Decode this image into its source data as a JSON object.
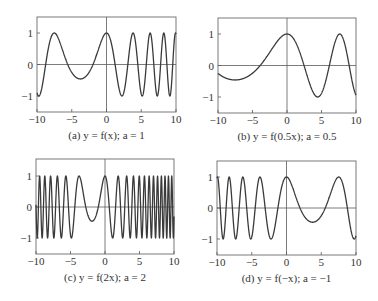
{
  "chart_data": [
    {
      "type": "line",
      "panel": "a",
      "caption": "(a) y = f(x); a = 1",
      "a": 1,
      "xlim": [
        -10,
        10
      ],
      "ylim": [
        -1.5,
        1.5
      ],
      "xticks": [
        -10,
        -5,
        0,
        5,
        10
      ],
      "yticks": [
        -1,
        0,
        1
      ],
      "xtick_labels": [
        "−10",
        "−5",
        "0",
        "5",
        "10"
      ],
      "ytick_labels": [
        "−1",
        "0",
        "1"
      ],
      "description": "Chirp-like curve: peak ~1 at x≈-7.5, min ≈-0.45 at x≈-4, peak 1 at x=0, then faster oscillation between -1 and 1 (peaks at ≈4, 6.7, 8.7)",
      "x": [
        -10,
        -7.5,
        -4,
        0,
        2.1,
        4,
        5.4,
        6.7,
        8,
        8.7,
        10
      ],
      "y": [
        -0.75,
        1,
        -0.45,
        1,
        -1,
        1,
        -1,
        1,
        -1,
        1,
        -0.9
      ]
    },
    {
      "type": "line",
      "panel": "b",
      "caption": "(b) y = f(0.5x); a = 0.5",
      "a": 0.5,
      "xlim": [
        -10,
        10
      ],
      "ylim": [
        -1.5,
        1.5
      ],
      "xticks": [
        -10,
        -5,
        0,
        5,
        10
      ],
      "yticks": [
        -1,
        0,
        1
      ],
      "xtick_labels": [
        "−10",
        "−5",
        "0",
        "5",
        "10"
      ],
      "ytick_labels": [
        "−1",
        "0",
        "1"
      ],
      "x": [
        -10,
        -8,
        -4,
        0,
        4.5,
        8.2,
        10
      ],
      "y": [
        -0.3,
        -0.45,
        0,
        1,
        -1,
        1,
        -0.3
      ]
    },
    {
      "type": "line",
      "panel": "c",
      "caption": "(c) y = f(2x); a = 2",
      "a": 2,
      "xlim": [
        -10,
        10
      ],
      "ylim": [
        -1.5,
        1.5
      ],
      "xticks": [
        -10,
        -5,
        0,
        5,
        10
      ],
      "yticks": [
        -1,
        0,
        1
      ],
      "xtick_labels": [
        "−10",
        "−5",
        "0",
        "5",
        "10"
      ],
      "ytick_labels": [
        "−1",
        "0",
        "1"
      ],
      "x": [
        -10,
        -3.75,
        -2,
        0,
        10
      ],
      "y": [
        -1,
        1,
        -0.45,
        1,
        1
      ]
    },
    {
      "type": "line",
      "panel": "d",
      "caption": "(d) y = f(−x); a = −1",
      "a": -1,
      "xlim": [
        -10,
        10
      ],
      "ylim": [
        -1.5,
        1.5
      ],
      "xticks": [
        -10,
        -5,
        0,
        5,
        10
      ],
      "yticks": [
        -1,
        0,
        1
      ],
      "xtick_labels": [
        "−10",
        "−5",
        "0",
        "5",
        "10"
      ],
      "ytick_labels": [
        "−1",
        "0",
        "1"
      ],
      "x": [
        -10,
        -8.7,
        -8,
        -6.7,
        -5.4,
        -4,
        -2.1,
        0,
        4,
        7.5,
        10
      ],
      "y": [
        -0.9,
        1,
        -1,
        1,
        -1,
        1,
        -1,
        1,
        -0.45,
        1,
        -0.75
      ]
    }
  ],
  "base_function": {
    "quad": 0.145,
    "lin": 1.09,
    "form": "f(x) = cos(quad*x^2 + lin*x)"
  },
  "panels_layout": [
    {
      "left": 37,
      "top": 17,
      "right": 176,
      "bottom": 112,
      "y1": 33,
      "y0": 64.5,
      "ym1": 96
    },
    {
      "left": 218,
      "top": 18,
      "right": 356,
      "bottom": 113,
      "y1": 34,
      "y0": 65.5,
      "ym1": 97
    },
    {
      "left": 36,
      "top": 159,
      "right": 174,
      "bottom": 254,
      "y1": 176,
      "y0": 207,
      "ym1": 238
    },
    {
      "left": 217,
      "top": 161,
      "right": 356,
      "bottom": 255,
      "y1": 177,
      "y0": 208,
      "ym1": 239
    }
  ]
}
